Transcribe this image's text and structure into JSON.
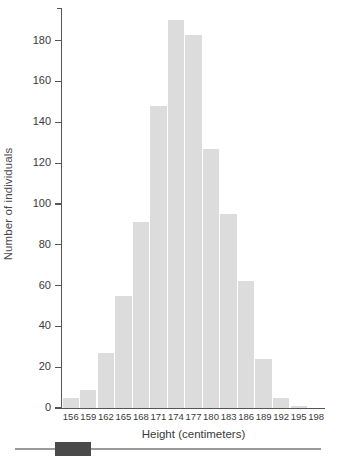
{
  "chart_data": {
    "type": "bar",
    "title": "",
    "xlabel": "Height (centimeters)",
    "ylabel": "Number of individuals",
    "categories": [
      "156",
      "159",
      "162",
      "165",
      "168",
      "171",
      "174",
      "177",
      "180",
      "183",
      "186",
      "189",
      "192",
      "195",
      "198"
    ],
    "values": [
      5,
      9,
      27,
      55,
      91,
      148,
      190,
      183,
      127,
      95,
      62,
      24,
      5,
      1,
      0
    ],
    "ylim": [
      0,
      196
    ],
    "xlim_note": "categorical bins centered on tick labels",
    "yticks": [
      0,
      20,
      40,
      60,
      80,
      100,
      120,
      140,
      160,
      180
    ],
    "ytick_labels": [
      "0",
      "20",
      "40",
      "60",
      "80",
      "100",
      "120",
      "140",
      "160",
      "180"
    ],
    "grid": false,
    "legend": null,
    "bar_color": "#dcdcdc",
    "axis_color": "#555555",
    "text_color": "#3a3a3a"
  },
  "scrollbar": {
    "track_color": "#9a9a9a",
    "thumb_color": "#4a4a4a"
  }
}
